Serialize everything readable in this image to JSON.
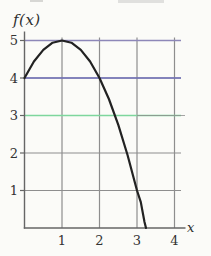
{
  "chart_data": {
    "type": "line",
    "title": "",
    "xlabel": "x",
    "ylabel": "f(x)",
    "xlim": [
      0,
      4.25
    ],
    "ylim": [
      0,
      5.4
    ],
    "x_ticks": [
      "1",
      "2",
      "3",
      "4"
    ],
    "y_ticks": [
      "1",
      "2",
      "3",
      "4",
      "5"
    ],
    "grid": "on",
    "grid_color": "#8e8e8e",
    "axis_color": "#666666",
    "series": [
      {
        "name": "f",
        "color": "#222222",
        "points": [
          [
            0,
            4
          ],
          [
            0.25,
            4.44
          ],
          [
            0.5,
            4.75
          ],
          [
            0.75,
            4.94
          ],
          [
            1,
            5
          ],
          [
            1.25,
            4.94
          ],
          [
            1.5,
            4.75
          ],
          [
            1.75,
            4.44
          ],
          [
            2,
            4
          ],
          [
            2.25,
            3.44
          ],
          [
            2.5,
            2.75
          ],
          [
            2.75,
            1.94
          ],
          [
            3,
            1
          ],
          [
            3.1,
            0.69
          ],
          [
            3.2,
            0.16
          ],
          [
            3.24,
            0
          ]
        ]
      }
    ],
    "highlight_lines": [
      {
        "y": 5,
        "color": "#8d87b8"
      },
      {
        "y": 4,
        "color": "#6e6eb8"
      },
      {
        "y": 3,
        "color": "#7ed69d"
      }
    ]
  }
}
